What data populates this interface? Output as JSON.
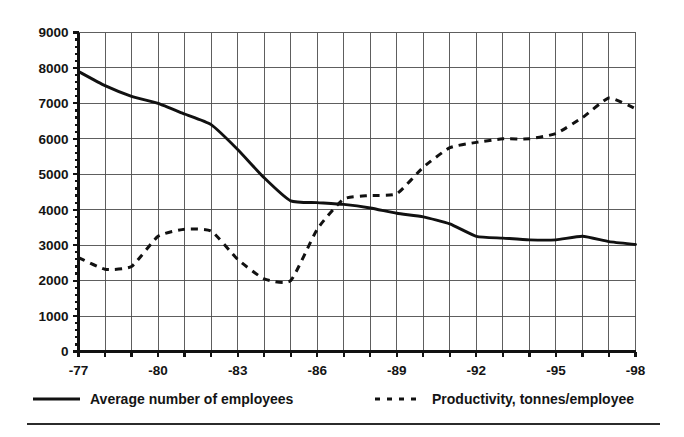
{
  "chart_data": {
    "type": "line",
    "title": "",
    "subtitle": "",
    "xlabel": "",
    "ylabel": "",
    "xlim": [
      -77,
      -98
    ],
    "ylim": [
      0,
      9000
    ],
    "grid": true,
    "legend_position": "bottom",
    "y_ticks": [
      0,
      1000,
      2000,
      3000,
      4000,
      5000,
      6000,
      7000,
      8000,
      9000
    ],
    "y_tick_labels": [
      "0",
      "1000",
      "2000",
      "3000",
      "4000",
      "5000",
      "6000",
      "7000",
      "8000",
      "9000"
    ],
    "x": [
      -77,
      -78,
      -79,
      -80,
      -81,
      -82,
      -83,
      -84,
      -85,
      -86,
      -87,
      -88,
      -89,
      -90,
      -91,
      -92,
      -93,
      -94,
      -95,
      -96,
      -97,
      -98
    ],
    "x_tick_labels": [
      "-77",
      "-80",
      "-83",
      "-86",
      "-89",
      "-92",
      "-95",
      "-98"
    ],
    "x_ticks_shown": [
      -77,
      -80,
      -83,
      -86,
      -89,
      -92,
      -95,
      -98
    ],
    "series": [
      {
        "name": "Average number of employees",
        "style": "solid",
        "color": "#111111",
        "values": [
          7900,
          7500,
          7200,
          7000,
          6700,
          6400,
          5700,
          4900,
          4250,
          4200,
          4150,
          4050,
          3900,
          3800,
          3600,
          3250,
          3200,
          3150,
          3150,
          3250,
          3100,
          3020
        ]
      },
      {
        "name": "Productivity, tonnes/employee",
        "style": "dashed",
        "color": "#111111",
        "values": [
          2650,
          2320,
          2400,
          3250,
          3450,
          3400,
          2600,
          2050,
          2000,
          3450,
          4300,
          4400,
          4450,
          5200,
          5750,
          5900,
          6000,
          6000,
          6150,
          6600,
          7150,
          6850
        ]
      }
    ]
  },
  "legend": {
    "items": [
      {
        "label": "Average number of employees",
        "style": "solid"
      },
      {
        "label": "Productivity, tonnes/employee",
        "style": "dashed"
      }
    ]
  }
}
